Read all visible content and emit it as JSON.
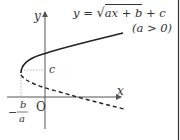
{
  "diagram": {
    "equation": "y = √(ax + b) + c",
    "equation_parts": {
      "lhs": "y = ",
      "radicand": "ax + b",
      "tail": " + c"
    },
    "condition": "(a > 0)",
    "axis_x_label": "x",
    "axis_y_label": "y",
    "origin_label": "O",
    "c_label": "c",
    "vertex_x_label": {
      "sign": "−",
      "numerator": "b",
      "denominator": "a"
    },
    "curves": [
      {
        "name": "y = √(ax+b) + c",
        "style": "solid"
      },
      {
        "name": "y = −√(ax+b) + c",
        "style": "dashed"
      }
    ],
    "colors": {
      "curve": "#222222",
      "axis": "#555555",
      "guide": "#aaaaaa",
      "border": "#333333"
    }
  }
}
